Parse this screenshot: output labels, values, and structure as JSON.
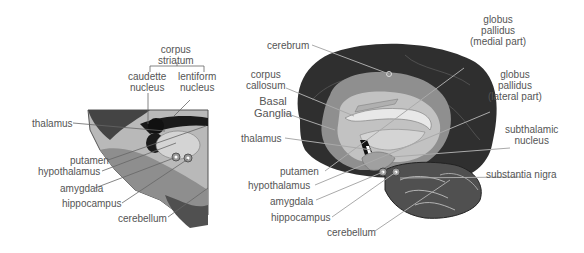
{
  "left_panel": {
    "group_label": [
      "corpus",
      "striatum"
    ],
    "labels": {
      "caudate": [
        "caudette",
        "nucleus"
      ],
      "lentiform": [
        "lentiform",
        "nucleus"
      ],
      "thalamus": "thalamus",
      "putamen": "putamen",
      "hypothalamus": "hypothalamus",
      "amygdala": "amygdala",
      "hippocampus": "hippocampus",
      "cerebellum": "cerebellum"
    }
  },
  "right_panel": {
    "labels": {
      "cerebrum": "cerebrum",
      "corpus_callosum": [
        "corpus",
        "callosum"
      ],
      "basal_ganglia": [
        "Basal",
        "Ganglia"
      ],
      "thalamus": "thalamus",
      "putamen": "putamen",
      "hypothalamus": "hypothalamus",
      "amygdala": "amygdala",
      "hippocampus": "hippocampus",
      "cerebellum": "cerebellum",
      "gp_medial": [
        "globus",
        "pallidus",
        "(medial part)"
      ],
      "gp_lateral": [
        "globus",
        "pallidus",
        "(lateral part)"
      ],
      "subthalamic": [
        "subthalamic",
        "nucleus"
      ],
      "substantia_nigra": "substantia nigra"
    }
  },
  "colors": {
    "cortex": "#2e2e2e",
    "white_matter": "#9a9a9a",
    "inner": "#c4c4c4",
    "label_text": "#555555",
    "leader_line": "#666666"
  }
}
